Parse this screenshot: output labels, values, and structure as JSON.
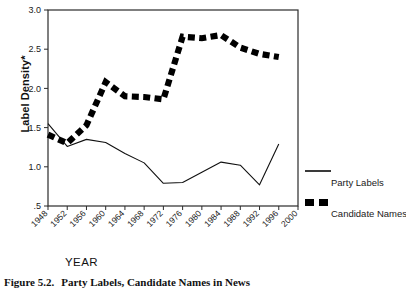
{
  "chart_data": {
    "type": "line",
    "title": "",
    "xlabel": "YEAR",
    "ylabel": "Label Density*",
    "x": [
      1948,
      1952,
      1956,
      1960,
      1964,
      1968,
      1972,
      1976,
      1980,
      1984,
      1988,
      1992,
      1996,
      2000
    ],
    "xticklabels": [
      "1948",
      "1952",
      "1956",
      "1960",
      "1964",
      "1968",
      "1972",
      "1976",
      "1980",
      "1984",
      "1988",
      "1992",
      "1996",
      "2000"
    ],
    "yticklabels": [
      "3.0",
      "2.5",
      "2.0",
      "1.5",
      "1.0",
      ".5"
    ],
    "ytickvalues": [
      3.0,
      2.5,
      2.0,
      1.5,
      1.0,
      0.5
    ],
    "ylim": [
      0.5,
      3.0
    ],
    "xlim": [
      1948,
      2000
    ],
    "grid": false,
    "legend_position": "outside-right",
    "series": [
      {
        "name": "Party Labels",
        "style": "thin-solid",
        "color": "#101010",
        "values": [
          1.55,
          1.26,
          1.35,
          1.31,
          1.17,
          1.05,
          0.79,
          0.8,
          0.93,
          1.06,
          1.02,
          0.77,
          1.29,
          null
        ]
      },
      {
        "name": "Candidate Names",
        "style": "thick-dashed",
        "color": "#000000",
        "values": [
          1.41,
          1.3,
          1.53,
          2.08,
          1.9,
          1.89,
          1.86,
          2.66,
          2.64,
          2.68,
          2.52,
          2.44,
          2.4,
          null
        ]
      }
    ]
  },
  "legend": {
    "items": [
      {
        "label": "Party Labels",
        "key": "thin-line-key"
      },
      {
        "label": "Candidate Names",
        "key": "thick-dash-key"
      }
    ]
  },
  "caption": {
    "number": "Figure 5.2.",
    "text": "Party Labels, Candidate Names in News"
  },
  "colors": {
    "axis": "#2b2b2b",
    "series_party_labels": "#101010",
    "series_candidate_names": "#000000",
    "background": "#ffffff"
  }
}
